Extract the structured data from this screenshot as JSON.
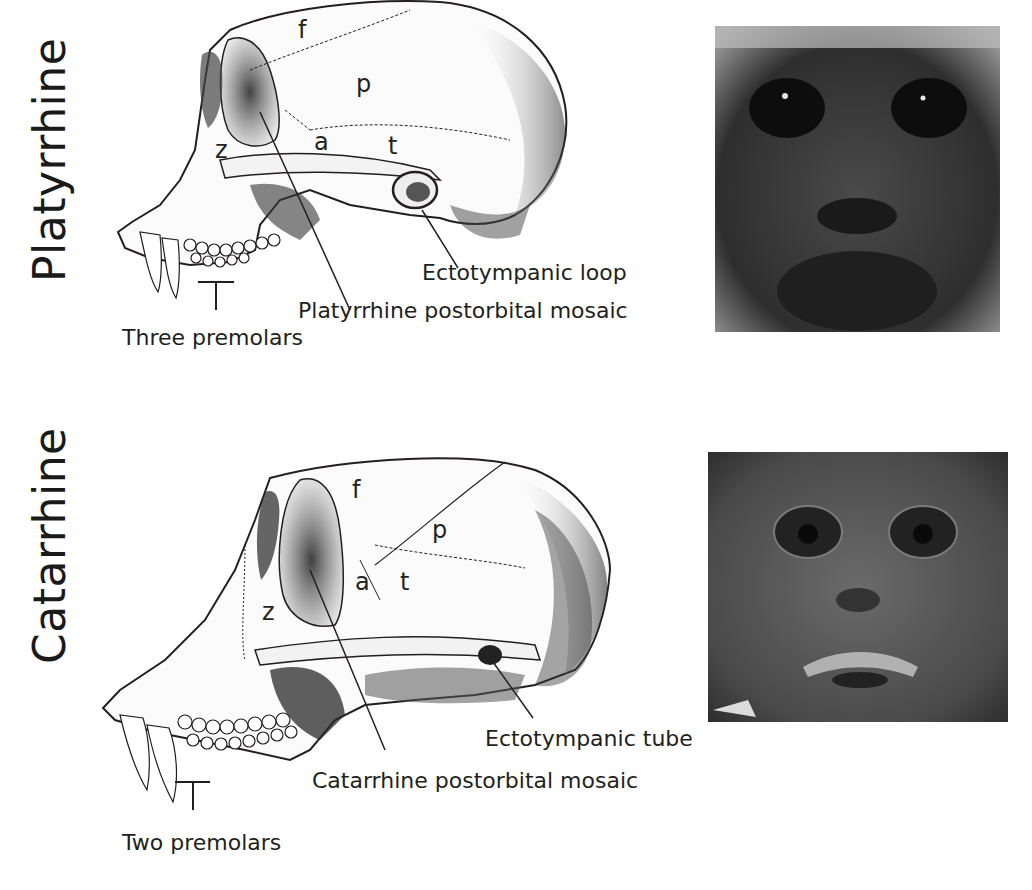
{
  "figure": {
    "panels": [
      {
        "group": "Platyrrhine",
        "bone_labels": {
          "frontal": "f",
          "parietal": "p",
          "alisphenoid": "a",
          "temporal": "t",
          "zygomatic": "z"
        },
        "callouts": {
          "ear": "Ectotympanic loop",
          "postorbital": "Platyrrhine postorbital mosaic",
          "teeth": "Three premolars"
        },
        "photo": "platyrrhine-face-photo"
      },
      {
        "group": "Catarrhine",
        "bone_labels": {
          "frontal": "f",
          "parietal": "p",
          "alisphenoid": "a",
          "temporal": "t",
          "zygomatic": "z"
        },
        "callouts": {
          "ear": "Ectotympanic tube",
          "postorbital": "Catarrhine postorbital mosaic",
          "teeth": "Two premolars"
        },
        "photo": "catarrhine-face-photo"
      }
    ],
    "colors": {
      "ink": "#231f20",
      "background": "#ffffff",
      "photo_dark": "#2e2e2e",
      "photo_mid": "#5a5a5a"
    }
  }
}
